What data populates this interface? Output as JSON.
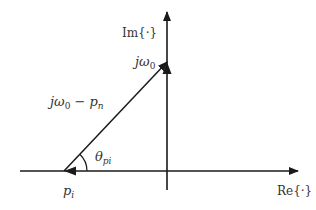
{
  "diagram": {
    "type": "s-plane vector diagram",
    "colors": {
      "line": "#1a1a1a",
      "text": "#333333",
      "background": "#ffffff"
    },
    "axes": {
      "imaginary": {
        "label": "Im{·}"
      },
      "real": {
        "label": "Re{·}"
      }
    },
    "points": {
      "jw0": {
        "label_main": "jω",
        "label_sub": "0"
      },
      "pole": {
        "label_main": "p",
        "label_sub": "i"
      }
    },
    "vector": {
      "label_main": "jω",
      "label_sub0": "0",
      "label_mid": " − p",
      "label_sub1": "n"
    },
    "angle": {
      "label_main": "θ",
      "label_sub": "pi"
    }
  }
}
